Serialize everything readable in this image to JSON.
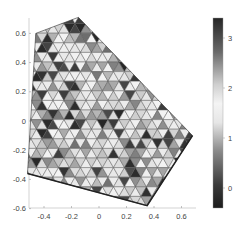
{
  "chart_data": {
    "type": "heatmap",
    "subtype": "triangular-mesh (trisurf / patch, viewed from top)",
    "title": "",
    "xlabel": "",
    "ylabel": "",
    "xlim": [
      -0.52,
      0.78
    ],
    "ylim": [
      -0.6,
      0.66
    ],
    "xticks": [
      -0.4,
      -0.2,
      0,
      0.2,
      0.4,
      0.6
    ],
    "xtick_labels": [
      "-0.4",
      "-0.2",
      "0",
      "0.2",
      "0.4",
      "0.6"
    ],
    "yticks": [
      -0.6,
      -0.4,
      -0.2,
      0,
      0.2,
      0.4,
      0.6
    ],
    "ytick_labels": [
      "-0.6",
      "-0.4",
      "-0.2",
      "0",
      "0.2",
      "0.4",
      "0.6"
    ],
    "grid": false,
    "domain_polygon": [
      [
        -0.46,
        0.6
      ],
      [
        -0.15,
        0.71
      ],
      [
        0.68,
        -0.1
      ],
      [
        0.35,
        -0.58
      ],
      [
        -0.52,
        -0.36
      ]
    ],
    "colorbar": {
      "position": "right",
      "range": [
        -0.4,
        3.4
      ],
      "ticks": [
        0,
        1,
        2,
        3
      ],
      "tick_labels": [
        "0",
        "1",
        "2",
        "3"
      ],
      "colormap": "gray, dark at both ends, light near 1.5–2"
    },
    "mesh_rows": 22,
    "mesh_cols": 30,
    "cell_values_seed": 7
  }
}
